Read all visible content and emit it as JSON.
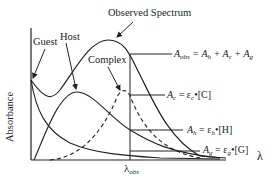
{
  "diagram": {
    "title": "Observed Spectrum",
    "axes": {
      "y_label": "Absorbance",
      "x_label": "λ",
      "x_marker": "λ",
      "x_marker_sub": "obs"
    },
    "curves": [
      {
        "name": "Guest",
        "style": "solid"
      },
      {
        "name": "Host",
        "style": "solid"
      },
      {
        "name": "Complex",
        "style": "dashed"
      },
      {
        "name": "Observed Spectrum",
        "style": "solid"
      }
    ],
    "equations": {
      "obs": {
        "lhs": "A",
        "lhs_sub": "obs",
        "rhs": " = A",
        "t1_sub": "h",
        "plus1": " + A",
        "t2_sub": "c",
        "plus2": " + A",
        "t3_sub": "g"
      },
      "complex": {
        "lhs": "A",
        "lhs_sub": "c",
        "rhs": " = ε",
        "eps_sub": "c",
        "conc": "•[C]"
      },
      "host": {
        "lhs": "A",
        "lhs_sub": "h",
        "rhs": " = ε",
        "eps_sub": "h",
        "conc": "•[H]"
      },
      "guest": {
        "lhs": "A",
        "lhs_sub": "g",
        "rhs": " = ε",
        "eps_sub": "g",
        "conc": "•[G]"
      }
    },
    "colors": {
      "line": "#222222",
      "background": "#ffffff"
    }
  }
}
